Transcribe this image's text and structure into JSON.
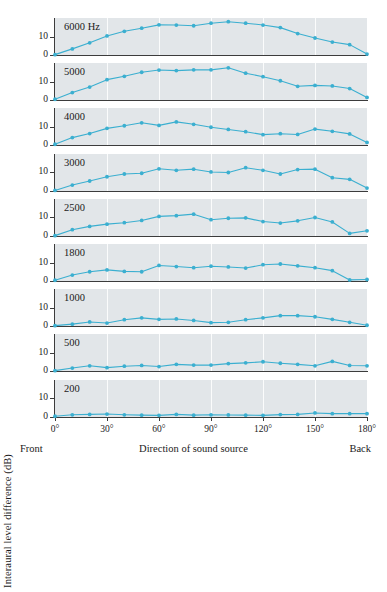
{
  "chart_data": {
    "type": "line",
    "title": "",
    "subtitle": "",
    "xlabel": "Direction of sound source",
    "ylabel": "Interaural level difference (dB)",
    "xlim": [
      0,
      180
    ],
    "ylim": [
      0,
      20
    ],
    "yticks": [
      0,
      10
    ],
    "ytick_labels": [
      "0",
      "10"
    ],
    "xticks": [
      0,
      30,
      60,
      90,
      120,
      150,
      180
    ],
    "xtick_labels": [
      "0°",
      "30°",
      "60°",
      "90°",
      "120°",
      "150°",
      "180°"
    ],
    "x_axis_end_labels": {
      "left": "Front",
      "right": "Back"
    },
    "grid": "vertical-white-gridlines-at-xticks",
    "legend": "none",
    "panel_layout": "9 stacked panels sharing one x-axis",
    "line_color": "#3BAFD0",
    "marker_color": "#3BAFD0",
    "panel_background": "#E2E6E9",
    "x": [
      0,
      10,
      20,
      30,
      40,
      50,
      60,
      70,
      80,
      90,
      100,
      110,
      120,
      130,
      140,
      150,
      160,
      170,
      180
    ],
    "series": [
      {
        "name": "6000 Hz",
        "label": "6000 Hz",
        "values": [
          0.2,
          3.3,
          6.6,
          10.3,
          12.8,
          14.5,
          16.3,
          16.2,
          15.8,
          17.2,
          18.0,
          17.2,
          16.2,
          14.8,
          11.6,
          9.2,
          7.0,
          5.6,
          0.5
        ]
      },
      {
        "name": "5000",
        "label": "5000",
        "values": [
          0.4,
          4.0,
          7.0,
          11.0,
          12.8,
          15.0,
          16.2,
          15.9,
          16.3,
          16.3,
          17.4,
          14.5,
          12.6,
          10.4,
          7.4,
          7.9,
          7.6,
          6.2,
          1.4
        ]
      },
      {
        "name": "4000",
        "label": "4000",
        "values": [
          0.4,
          4.0,
          6.2,
          9.0,
          10.4,
          12.0,
          10.6,
          12.5,
          11.2,
          9.6,
          8.4,
          7.2,
          5.6,
          6.1,
          5.7,
          8.6,
          7.4,
          6.0,
          1.4
        ]
      },
      {
        "name": "3000",
        "label": "3000",
        "values": [
          0.3,
          3.2,
          5.4,
          7.7,
          9.2,
          9.6,
          12.0,
          11.2,
          11.8,
          10.3,
          10.0,
          12.6,
          11.2,
          9.2,
          11.6,
          11.8,
          7.2,
          6.3,
          1.6
        ]
      },
      {
        "name": "2500",
        "label": "2500",
        "values": [
          0.2,
          3.4,
          5.2,
          6.4,
          7.2,
          8.4,
          10.6,
          11.0,
          11.8,
          8.8,
          9.6,
          9.8,
          7.8,
          7.0,
          8.2,
          10.0,
          7.6,
          1.4,
          2.8
        ]
      },
      {
        "name": "1800",
        "label": "1800",
        "values": [
          0.4,
          3.2,
          5.0,
          6.0,
          5.2,
          5.0,
          8.4,
          7.8,
          7.2,
          8.0,
          7.6,
          7.0,
          8.8,
          9.2,
          8.2,
          7.2,
          5.6,
          0.6,
          0.8
        ]
      },
      {
        "name": "1000",
        "label": "1000",
        "values": [
          0.2,
          1.0,
          2.2,
          1.6,
          3.4,
          4.4,
          3.6,
          3.8,
          3.0,
          1.8,
          2.0,
          3.4,
          4.4,
          5.6,
          5.6,
          5.0,
          3.6,
          2.0,
          0.4
        ]
      },
      {
        "name": "500",
        "label": "500",
        "values": [
          0.2,
          1.6,
          2.8,
          1.8,
          2.6,
          3.0,
          2.4,
          3.6,
          3.2,
          3.2,
          4.0,
          4.4,
          5.0,
          4.2,
          3.6,
          2.8,
          5.2,
          3.0,
          2.8
        ]
      },
      {
        "name": "200",
        "label": "200",
        "values": [
          0.4,
          1.2,
          1.4,
          1.6,
          1.2,
          1.0,
          0.9,
          1.4,
          1.0,
          1.2,
          1.1,
          1.0,
          0.9,
          1.3,
          1.4,
          2.2,
          1.8,
          1.8,
          1.8
        ]
      }
    ]
  },
  "axis": {
    "ylabel": "Interaural level difference (dB)",
    "xlabel": "Direction of sound source",
    "front_label": "Front",
    "back_label": "Back"
  }
}
